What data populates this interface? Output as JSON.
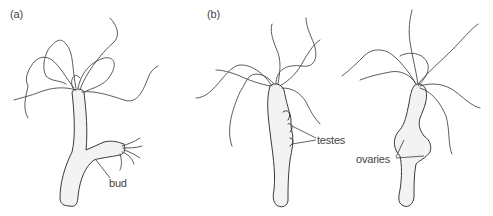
{
  "figure": {
    "panels": [
      {
        "id": "a",
        "label": "(a)",
        "annotations": [
          {
            "text": "bud"
          }
        ]
      },
      {
        "id": "b",
        "label": "(b)",
        "annotations": [
          {
            "text": "testes"
          },
          {
            "text": "ovaries"
          }
        ]
      }
    ]
  },
  "colors": {
    "line": "#3a3a3a",
    "fill": "#f3f3f3",
    "text": "#444444",
    "background": "#ffffff"
  }
}
